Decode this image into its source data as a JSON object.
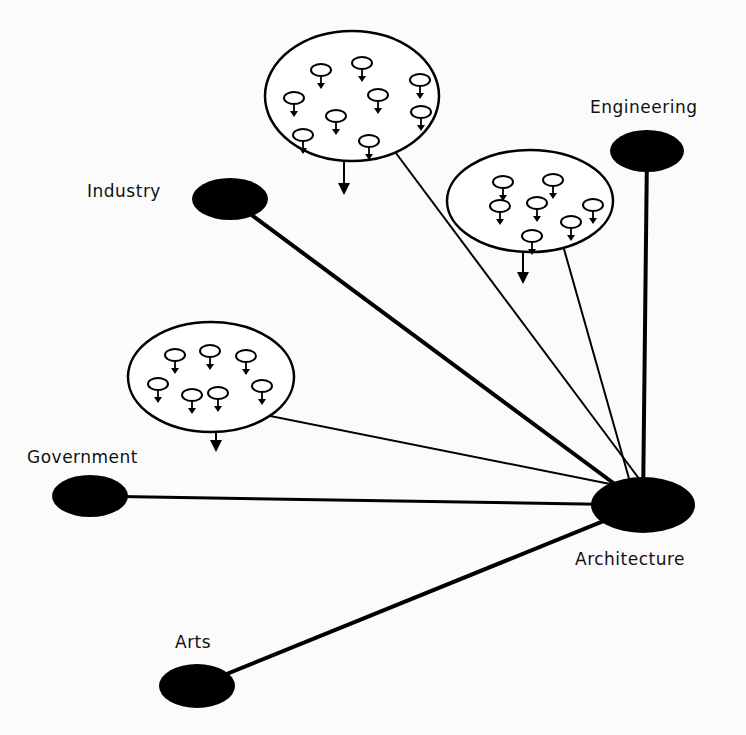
{
  "diagram": {
    "center_node": {
      "id": "architecture",
      "label": "Architecture",
      "cx": 643,
      "cy": 505,
      "rx": 52,
      "ry": 28,
      "label_x": 575,
      "label_y": 565
    },
    "nodes": [
      {
        "id": "engineering",
        "label": "Engineering",
        "cx": 647,
        "cy": 151,
        "rx": 37,
        "ry": 21,
        "label_x": 590,
        "label_y": 113,
        "line_width": 4
      },
      {
        "id": "industry",
        "label": "Industry",
        "cx": 230,
        "cy": 199,
        "rx": 38,
        "ry": 21,
        "label_x": 87,
        "label_y": 197,
        "line_width": 4
      },
      {
        "id": "government",
        "label": "Government",
        "cx": 90,
        "cy": 496,
        "rx": 38,
        "ry": 21,
        "label_x": 27,
        "label_y": 463,
        "line_width": 3
      },
      {
        "id": "arts",
        "label": "Arts",
        "cx": 197,
        "cy": 686,
        "rx": 38,
        "ry": 22,
        "label_x": 175,
        "label_y": 648,
        "line_width": 4
      }
    ],
    "groups": [
      {
        "id": "group-top",
        "cx": 352,
        "cy": 96,
        "rx": 87,
        "ry": 65,
        "line_to": [
          640,
          480
        ],
        "arrow": [
          344,
          160,
          344,
          193
        ],
        "members": [
          [
            321,
            70
          ],
          [
            362,
            63
          ],
          [
            420,
            80
          ],
          [
            294,
            98
          ],
          [
            378,
            95
          ],
          [
            336,
            116
          ],
          [
            421,
            112
          ],
          [
            303,
            135
          ],
          [
            369,
            141
          ]
        ]
      },
      {
        "id": "group-right",
        "cx": 530,
        "cy": 201,
        "rx": 83,
        "ry": 51,
        "line_to": [
          630,
          482
        ],
        "arrow": [
          523,
          252,
          523,
          282
        ],
        "members": [
          [
            503,
            182
          ],
          [
            553,
            180
          ],
          [
            500,
            206
          ],
          [
            537,
            203
          ],
          [
            593,
            205
          ],
          [
            571,
            222
          ],
          [
            532,
            236
          ]
        ]
      },
      {
        "id": "group-left",
        "cx": 211,
        "cy": 377,
        "rx": 83,
        "ry": 55,
        "line_to": [
          620,
          486
        ],
        "arrow": [
          216,
          432,
          216,
          450
        ],
        "members": [
          [
            175,
            355
          ],
          [
            210,
            351
          ],
          [
            246,
            356
          ],
          [
            158,
            384
          ],
          [
            192,
            395
          ],
          [
            218,
            393
          ],
          [
            262,
            386
          ]
        ]
      }
    ]
  }
}
